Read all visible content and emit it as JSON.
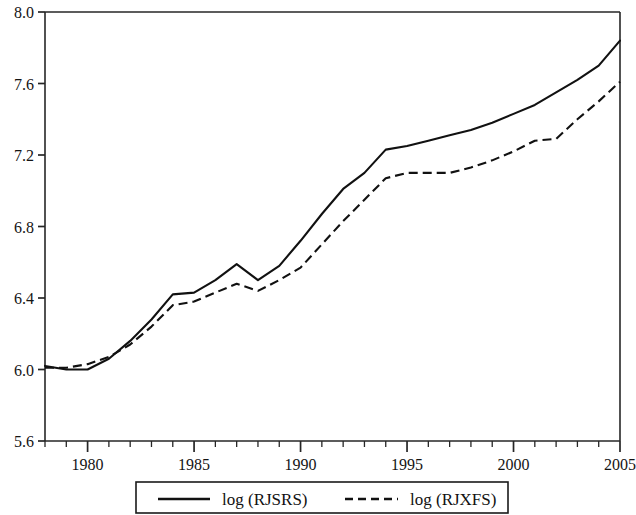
{
  "chart_data": {
    "type": "line",
    "title": "",
    "subtitle": "",
    "xlabel": "",
    "ylabel": "",
    "xlim": [
      1978,
      2005
    ],
    "ylim": [
      5.6,
      8.0
    ],
    "grid": false,
    "legend_position": "bottom-outside",
    "y_ticks": [
      "8.0",
      "7.6",
      "7.2",
      "6.8",
      "6.4",
      "6.0",
      "5.6"
    ],
    "y_tick_values": [
      8.0,
      7.6,
      7.2,
      6.8,
      6.4,
      6.0,
      5.6
    ],
    "x_ticks": [
      "1980",
      "1985",
      "1990",
      "1995",
      "2000",
      "2005"
    ],
    "x_tick_values": [
      1980,
      1985,
      1990,
      1995,
      2000,
      2005
    ],
    "x_minor_tick_interval": 1,
    "x": [
      1978,
      1979,
      1980,
      1981,
      1982,
      1983,
      1984,
      1985,
      1986,
      1987,
      1988,
      1989,
      1990,
      1991,
      1992,
      1993,
      1994,
      1995,
      1996,
      1997,
      1998,
      1999,
      2000,
      2001,
      2002,
      2003,
      2004,
      2005
    ],
    "series": [
      {
        "name": "log (RJSRS)",
        "style": "solid",
        "color": "#111111",
        "values": [
          6.02,
          6.0,
          6.0,
          6.06,
          6.16,
          6.28,
          6.42,
          6.43,
          6.5,
          6.59,
          6.5,
          6.58,
          6.72,
          6.87,
          7.01,
          7.1,
          7.23,
          7.25,
          7.28,
          7.31,
          7.34,
          7.38,
          7.43,
          7.48,
          7.55,
          7.62,
          7.7,
          7.84
        ]
      },
      {
        "name": "log (RJXFS)",
        "style": "dashed",
        "color": "#111111",
        "values": [
          6.01,
          6.01,
          6.03,
          6.07,
          6.14,
          6.24,
          6.36,
          6.38,
          6.43,
          6.48,
          6.44,
          6.5,
          6.57,
          6.7,
          6.83,
          6.95,
          7.07,
          7.1,
          7.1,
          7.1,
          7.13,
          7.17,
          7.22,
          7.28,
          7.29,
          7.4,
          7.5,
          7.61
        ]
      }
    ]
  },
  "legend": {
    "entries": [
      {
        "label": "log (RJSRS)",
        "style": "solid"
      },
      {
        "label": "log (RJXFS)",
        "style": "dashed"
      }
    ]
  }
}
